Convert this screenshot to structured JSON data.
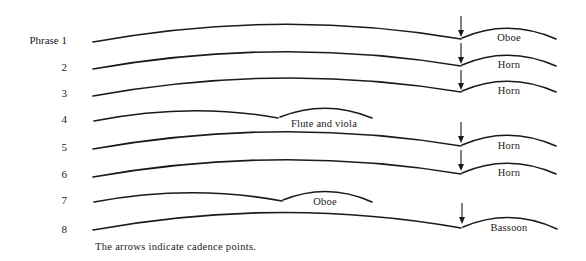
{
  "diagram": {
    "phrases": [
      {
        "label": "Phrase 1",
        "cadence_arrow": true,
        "continuation": "Oboe"
      },
      {
        "label": "2",
        "cadence_arrow": true,
        "continuation": "Horn"
      },
      {
        "label": "3",
        "cadence_arrow": true,
        "continuation": "Horn"
      },
      {
        "label": "4",
        "cadence_arrow": false,
        "continuation": "Flute and viola"
      },
      {
        "label": "5",
        "cadence_arrow": true,
        "continuation": "Horn"
      },
      {
        "label": "6",
        "cadence_arrow": true,
        "continuation": "Horn"
      },
      {
        "label": "7",
        "cadence_arrow": false,
        "continuation": "Oboe"
      },
      {
        "label": "8",
        "cadence_arrow": true,
        "continuation": "Bassoon"
      }
    ],
    "caption": "The arrows indicate cadence points."
  }
}
